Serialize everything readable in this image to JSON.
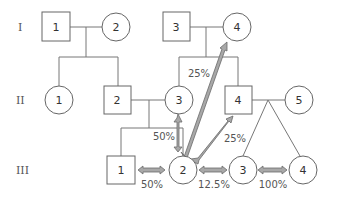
{
  "diagram": {
    "type": "pedigree",
    "generations": [
      "I",
      "II",
      "III"
    ],
    "individuals": {
      "I-1": {
        "label": "1",
        "sex": "male"
      },
      "I-2": {
        "label": "2",
        "sex": "female"
      },
      "I-3": {
        "label": "3",
        "sex": "male"
      },
      "I-4": {
        "label": "4",
        "sex": "female"
      },
      "II-1": {
        "label": "1",
        "sex": "female"
      },
      "II-2": {
        "label": "2",
        "sex": "male"
      },
      "II-3": {
        "label": "3",
        "sex": "female"
      },
      "II-4": {
        "label": "4",
        "sex": "male"
      },
      "II-5": {
        "label": "5",
        "sex": "female"
      },
      "III-1": {
        "label": "1",
        "sex": "male"
      },
      "III-2": {
        "label": "2",
        "sex": "female"
      },
      "III-3": {
        "label": "3",
        "sex": "female"
      },
      "III-4": {
        "label": "4",
        "sex": "female"
      }
    },
    "relatedness": [
      {
        "from": "III-2",
        "to": "I-4",
        "label": "25%"
      },
      {
        "from": "III-2",
        "to": "II-3",
        "label": "50%"
      },
      {
        "from": "III-2",
        "to": "II-4",
        "label": "25%"
      },
      {
        "from": "III-1",
        "to": "III-2",
        "label": "50%"
      },
      {
        "from": "III-2",
        "to": "III-3",
        "label": "12.5%"
      },
      {
        "from": "III-3",
        "to": "III-4",
        "label": "100%"
      }
    ],
    "colors": {
      "arrow_fill": "#a8a8a8",
      "arrow_stroke": "#6a6a6a",
      "line": "#777777"
    }
  }
}
